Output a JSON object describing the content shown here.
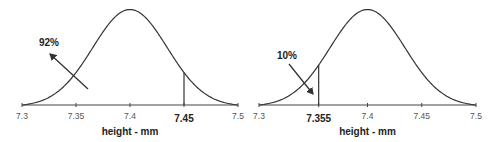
{
  "chart_data": [
    {
      "type": "area",
      "title": "",
      "description": "Normal distribution curve of height; area to the left of 7.45 is 92%",
      "xlabel": "height - mm",
      "ylabel": "",
      "xlim": [
        7.3,
        7.5
      ],
      "x_ticks": [
        "7.3",
        "7.35",
        "7.4",
        "7.45",
        "7.5"
      ],
      "highlighted_tick": "7.45",
      "mean": 7.4,
      "marker_x": 7.45,
      "annotation": {
        "text": "92%",
        "points_to": "area left of 7.45"
      },
      "grid": false,
      "legend": null
    },
    {
      "type": "area",
      "title": "",
      "description": "Normal distribution curve of height; area to the left of 7.355 is 10%",
      "xlabel": "height - mm",
      "ylabel": "",
      "xlim": [
        7.3,
        7.5
      ],
      "x_ticks": [
        "7.3",
        "7.355",
        "7.4",
        "7.45",
        "7.5"
      ],
      "highlighted_tick": "7.355",
      "mean": 7.4,
      "marker_x": 7.355,
      "annotation": {
        "text": "10%",
        "points_to": "area left of 7.355"
      },
      "grid": false,
      "legend": null
    }
  ],
  "panels": [
    {
      "axis": {
        "x0": 22,
        "x1": 238,
        "y": 105
      },
      "peak_y": 8,
      "ticks": [
        {
          "label": "7.3",
          "value": 7.3,
          "bold": false
        },
        {
          "label": "7.35",
          "value": 7.35,
          "bold": false
        },
        {
          "label": "7.4",
          "value": 7.4,
          "bold": false
        },
        {
          "label": "7.45",
          "value": 7.45,
          "bold": true
        },
        {
          "label": "7.5",
          "value": 7.5,
          "bold": false
        }
      ],
      "marker_value": 7.45,
      "xlabel": "height - mm",
      "pct_label": "92%",
      "pct_pos": [
        49,
        46
      ],
      "arrow": {
        "from": [
          88,
          89
        ],
        "to": [
          50,
          54
        ]
      }
    },
    {
      "axis": {
        "x0": 259,
        "x1": 476,
        "y": 105
      },
      "peak_y": 8,
      "ticks": [
        {
          "label": "7.3",
          "value": 7.3,
          "bold": false
        },
        {
          "label": "7.355",
          "value": 7.355,
          "bold": true
        },
        {
          "label": "7.4",
          "value": 7.4,
          "bold": false
        },
        {
          "label": "7.45",
          "value": 7.45,
          "bold": false
        },
        {
          "label": "7.5",
          "value": 7.5,
          "bold": false
        }
      ],
      "marker_value": 7.355,
      "xlabel": "height - mm",
      "pct_label": "10%",
      "pct_pos": [
        287,
        59
      ],
      "arrow": {
        "from": [
          289,
          64
        ],
        "to": [
          313,
          94
        ]
      }
    }
  ],
  "colors": {
    "line": "#333333",
    "axis": "#444444",
    "text": "#222222"
  }
}
